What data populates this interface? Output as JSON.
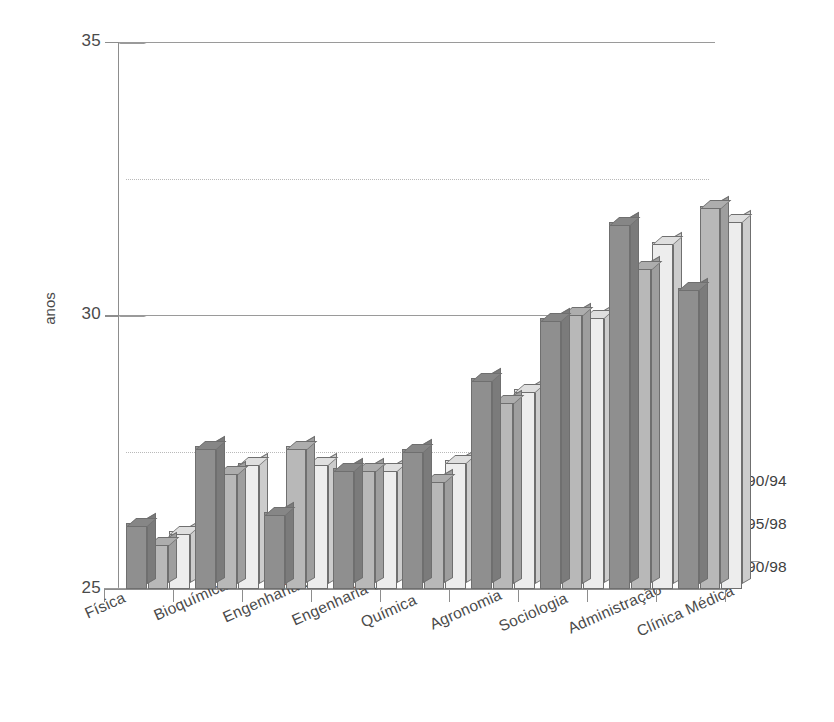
{
  "chart_data": {
    "type": "bar",
    "title": "",
    "xlabel": "",
    "ylabel": "anos",
    "ylim": [
      25,
      35
    ],
    "yticks": [
      25,
      30,
      35
    ],
    "ytick_labels": [
      "25",
      "30",
      "35"
    ],
    "gridlines_dotted": [
      27.5,
      32.5
    ],
    "grid": true,
    "legend_position": "right",
    "style": "3d-bar",
    "categories": [
      "Física",
      "Bioquímica",
      "Engenharia Elétrica",
      "Engenharia Civil",
      "Química",
      "Agronomia",
      "Sociologia",
      "Administração",
      "Clínica Médica"
    ],
    "series": [
      {
        "name": "90/94",
        "color": "#8f8f8f",
        "values": [
          26.2,
          27.6,
          26.4,
          27.2,
          27.55,
          28.85,
          29.95,
          31.7,
          30.5
        ]
      },
      {
        "name": "95/98",
        "color": "#b8b8b8",
        "values": [
          25.85,
          27.15,
          27.6,
          27.2,
          27.0,
          28.45,
          30.05,
          30.9,
          32.0
        ]
      },
      {
        "name": "90/98",
        "color": "#ededed",
        "values": [
          26.05,
          27.3,
          27.3,
          27.2,
          27.35,
          28.65,
          30.0,
          31.35,
          31.75
        ]
      }
    ]
  },
  "legend": {
    "items": [
      {
        "label": "90/94",
        "color": "#8f8f8f"
      },
      {
        "label": "95/98",
        "color": "#b8b8b8"
      },
      {
        "label": "90/98",
        "color": "#ededed"
      }
    ]
  },
  "axis": {
    "y_caption": "anos"
  }
}
